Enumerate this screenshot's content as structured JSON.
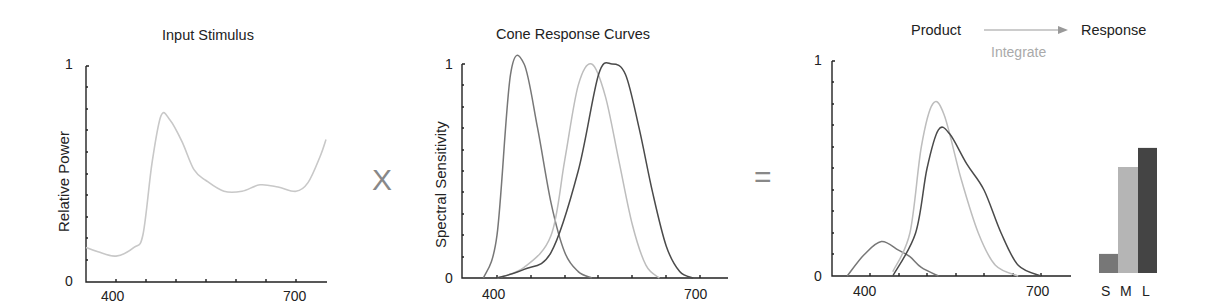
{
  "panels": {
    "stimulus": {
      "title": "Input Stimulus",
      "ylabel": "Relative Power",
      "y_top": "1",
      "y_bottom": "0",
      "x_ticks": [
        "400",
        "700"
      ]
    },
    "cones": {
      "title": "Cone Response Curves",
      "ylabel": "Spectral Sensitivity",
      "y_top": "1",
      "y_bottom": "0",
      "x_ticks": [
        "400",
        "700"
      ]
    },
    "product": {
      "title": "Product",
      "arrow_label": "Integrate",
      "result_title": "Response",
      "y_top": "1",
      "y_bottom": "0",
      "x_ticks": [
        "400",
        "700"
      ],
      "bar_labels": [
        "S",
        "M",
        "L"
      ]
    }
  },
  "operators": {
    "multiply": "X",
    "equals": "="
  },
  "colors": {
    "axis": "#222222",
    "stimulus": "#c8c8c8",
    "s_cone": "#777777",
    "m_cone": "#bdbdbd",
    "l_cone": "#4a4a4a",
    "s_bar": "#777777",
    "m_bar": "#b5b5b5",
    "l_bar": "#444444",
    "operator": "#888888",
    "integrate": "#aaaaaa"
  },
  "chart_data": [
    {
      "type": "line",
      "title": "Input Stimulus",
      "xlabel": "",
      "ylabel": "Relative Power",
      "xlim": [
        350,
        750
      ],
      "ylim": [
        0,
        1
      ],
      "x_ticks": [
        400,
        700
      ],
      "series": [
        {
          "name": "Stimulus",
          "x": [
            350,
            370,
            400,
            430,
            445,
            460,
            475,
            490,
            510,
            530,
            550,
            580,
            610,
            640,
            670,
            700,
            720,
            740,
            750
          ],
          "y": [
            0.16,
            0.14,
            0.12,
            0.16,
            0.22,
            0.55,
            0.77,
            0.75,
            0.65,
            0.52,
            0.47,
            0.42,
            0.42,
            0.45,
            0.44,
            0.42,
            0.46,
            0.58,
            0.66
          ]
        }
      ]
    },
    {
      "type": "line",
      "title": "Cone Response Curves",
      "xlabel": "",
      "ylabel": "Spectral Sensitivity",
      "xlim": [
        350,
        750
      ],
      "ylim": [
        0,
        1
      ],
      "x_ticks": [
        400,
        700
      ],
      "series": [
        {
          "name": "S",
          "x": [
            380,
            400,
            420,
            440,
            460,
            480,
            500,
            520,
            540
          ],
          "y": [
            0.0,
            0.2,
            0.95,
            1.0,
            0.7,
            0.35,
            0.12,
            0.03,
            0.0
          ]
        },
        {
          "name": "M",
          "x": [
            400,
            440,
            480,
            500,
            520,
            540,
            560,
            580,
            600,
            620,
            640
          ],
          "y": [
            0.0,
            0.05,
            0.2,
            0.55,
            0.9,
            1.0,
            0.85,
            0.55,
            0.25,
            0.06,
            0.0
          ]
        },
        {
          "name": "L",
          "x": [
            400,
            440,
            480,
            520,
            550,
            570,
            590,
            610,
            630,
            650,
            670,
            690
          ],
          "y": [
            0.0,
            0.04,
            0.12,
            0.5,
            0.95,
            1.0,
            0.95,
            0.7,
            0.4,
            0.15,
            0.03,
            0.0
          ]
        }
      ]
    },
    {
      "type": "line",
      "title": "Product",
      "xlabel": "",
      "ylabel": "",
      "xlim": [
        335,
        750
      ],
      "ylim": [
        0,
        1
      ],
      "x_ticks": [
        400,
        700
      ],
      "series": [
        {
          "name": "S x stimulus",
          "x": [
            360,
            390,
            420,
            450,
            470,
            490,
            520
          ],
          "y": [
            0.0,
            0.1,
            0.16,
            0.12,
            0.09,
            0.04,
            0.0
          ]
        },
        {
          "name": "M x stimulus",
          "x": [
            440,
            470,
            490,
            510,
            530,
            560,
            590,
            620,
            660
          ],
          "y": [
            0.02,
            0.2,
            0.6,
            0.8,
            0.75,
            0.45,
            0.2,
            0.05,
            0.0
          ]
        },
        {
          "name": "L x stimulus",
          "x": [
            440,
            480,
            500,
            520,
            540,
            570,
            600,
            630,
            660,
            700
          ],
          "y": [
            0.0,
            0.2,
            0.5,
            0.68,
            0.66,
            0.52,
            0.4,
            0.2,
            0.05,
            0.0
          ]
        }
      ]
    },
    {
      "type": "bar",
      "title": "Response",
      "categories": [
        "S",
        "M",
        "L"
      ],
      "values": [
        0.09,
        0.5,
        0.59
      ],
      "ylim": [
        0,
        1
      ]
    }
  ]
}
